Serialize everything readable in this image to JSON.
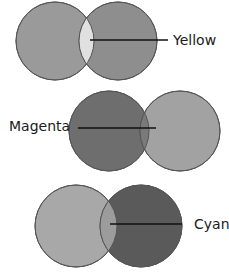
{
  "diagrams": [
    {
      "label": "Yellow",
      "left_circle": {
        "cx": 55,
        "cy": 41,
        "r": 39,
        "fill": "#9a9a9a"
      },
      "right_circle": {
        "cx": 118,
        "cy": 41,
        "r": 39,
        "fill": "#8e8e8e"
      },
      "overlap_fill": "#e0e0e0",
      "line": {
        "x1": 90,
        "y1": 40,
        "x2": 168,
        "y2": 40
      },
      "label_pos": {
        "x": 173,
        "y": 45
      }
    },
    {
      "label": "Magenta",
      "left_circle": {
        "cx": 109,
        "cy": 131,
        "r": 40,
        "fill": "#6e6e6e"
      },
      "right_circle": {
        "cx": 180,
        "cy": 131,
        "r": 40,
        "fill": "#a2a2a2"
      },
      "overlap_fill": "#7a7a7a",
      "line": {
        "x1": 78,
        "y1": 128,
        "x2": 156,
        "y2": 128
      },
      "label_pos": {
        "x": 9,
        "y": 131
      }
    },
    {
      "label": "Cyan",
      "left_circle": {
        "cx": 76,
        "cy": 226,
        "r": 41,
        "fill": "#a8a8a8"
      },
      "right_circle": {
        "cx": 141,
        "cy": 226,
        "r": 41,
        "fill": "#5a5a5a"
      },
      "overlap_fill": "#9c9c9c",
      "line": {
        "x1": 110,
        "y1": 224,
        "x2": 182,
        "y2": 224
      },
      "label_pos": {
        "x": 194,
        "y": 229
      }
    }
  ]
}
